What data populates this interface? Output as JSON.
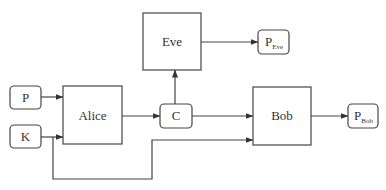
{
  "diagram": {
    "type": "block-diagram",
    "nodes": {
      "p": {
        "label": "P",
        "shape": "rounded"
      },
      "k": {
        "label": "K",
        "shape": "rounded"
      },
      "alice": {
        "label": "Alice",
        "shape": "rect"
      },
      "c": {
        "label": "C",
        "shape": "rounded"
      },
      "eve": {
        "label": "Eve",
        "shape": "rect"
      },
      "p_eve": {
        "label": "P",
        "subscript": "Eve",
        "shape": "rounded"
      },
      "bob": {
        "label": "Bob",
        "shape": "rect"
      },
      "p_bob": {
        "label": "P",
        "subscript": "Bob",
        "shape": "rounded"
      }
    },
    "edges": [
      {
        "from": "P",
        "to": "Alice"
      },
      {
        "from": "K",
        "to": "Alice"
      },
      {
        "from": "Alice",
        "to": "C"
      },
      {
        "from": "C",
        "to": "Eve"
      },
      {
        "from": "C",
        "to": "Bob"
      },
      {
        "from": "K",
        "to": "Bob"
      },
      {
        "from": "Eve",
        "to": "P_Eve"
      },
      {
        "from": "Bob",
        "to": "P_Bob"
      }
    ],
    "colors": {
      "stroke": "#444444",
      "text": "#333333",
      "background": "#ffffff"
    }
  }
}
